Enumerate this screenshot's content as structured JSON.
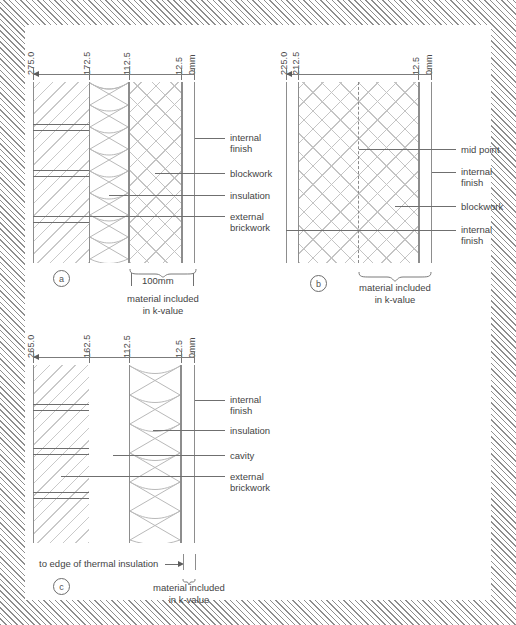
{
  "figures": [
    {
      "id": "a",
      "letter": "a",
      "dimensions": [
        "275.0",
        "172.5",
        "112.5",
        "12.5",
        "0mm"
      ],
      "labels": [
        "internal finish",
        "blockwork",
        "insulation",
        "external brickwork"
      ],
      "scale_label": "100mm",
      "kvalue_caption_line1": "material included",
      "kvalue_caption_line2": "in k-value"
    },
    {
      "id": "b",
      "letter": "b",
      "dimensions": [
        "225.0",
        "212.5",
        "12.5",
        "0mm"
      ],
      "labels": [
        "mid point",
        "internal finish",
        "blockwork",
        "internal finish"
      ],
      "kvalue_caption_line1": "material included",
      "kvalue_caption_line2": "in k-value"
    },
    {
      "id": "c",
      "letter": "c",
      "dimensions": [
        "265.0",
        "162.5",
        "112.5",
        "12.5",
        "0mm"
      ],
      "labels": [
        "internal finish",
        "insulation",
        "cavity",
        "external brickwork"
      ],
      "edge_note": "to edge of thermal insulation",
      "kvalue_caption_line1": "material included",
      "kvalue_caption_line2": "in k-value"
    }
  ],
  "fig_a": {
    "dim_0": "275.0",
    "dim_1": "172.5",
    "dim_2": "112.5",
    "dim_3": "12.5",
    "dim_4": "0mm",
    "label_0": "internal",
    "label_0b": "finish",
    "label_1": "blockwork",
    "label_2": "insulation",
    "label_3": "external",
    "label_3b": "brickwork",
    "scale": "100mm",
    "k1": "material included",
    "k2": "in k-value",
    "letter": "a"
  },
  "fig_b": {
    "dim_0": "225.0",
    "dim_1": "212.5",
    "dim_2": "12.5",
    "dim_3": "0mm",
    "label_0": "mid point",
    "label_1": "internal",
    "label_1b": "finish",
    "label_2": "blockwork",
    "label_3": "internal",
    "label_3b": "finish",
    "k1": "material included",
    "k2": "in k-value",
    "letter": "b"
  },
  "fig_c": {
    "dim_0": "265.0",
    "dim_1": "162.5",
    "dim_2": "112.5",
    "dim_3": "12.5",
    "dim_4": "0mm",
    "label_0": "internal",
    "label_0b": "finish",
    "label_1": "insulation",
    "label_2": "cavity",
    "label_3": "external",
    "label_3b": "brickwork",
    "edge_note": "to edge of thermal insulation",
    "k1": "material included",
    "k2": "in k-value",
    "letter": "c"
  },
  "colors": {
    "line": "#8d8d8d",
    "hatch": "#c4c4c4",
    "text": "#444444",
    "border_hatch": "#8e8e8e"
  }
}
